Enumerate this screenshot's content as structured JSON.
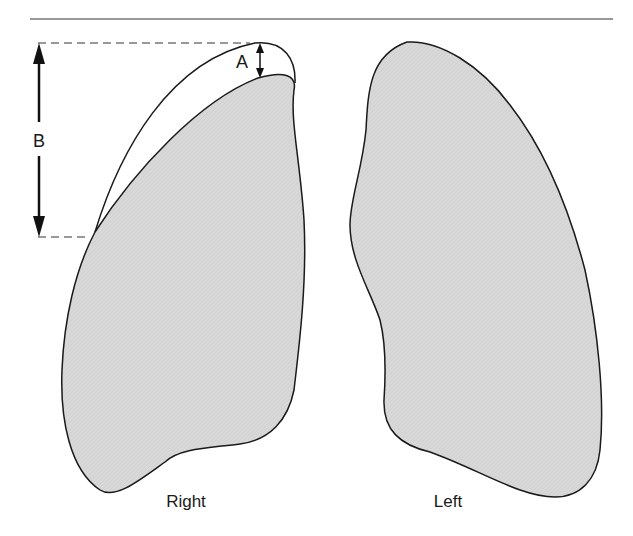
{
  "diagram": {
    "type": "anatomical-illustration",
    "labels": {
      "right_lung": "Right",
      "left_lung": "Left",
      "dimension_a": "A",
      "dimension_b": "B"
    },
    "colors": {
      "lung_fill": "#d6d6d6",
      "outline": "#1a1a1a",
      "rule": "#333333",
      "background": "#ffffff"
    }
  }
}
